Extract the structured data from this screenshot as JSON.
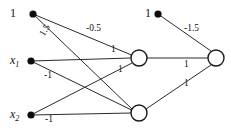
{
  "diagram": {
    "background_color": "#ffffff",
    "stroke_color": "#2b2b2b",
    "node_fill": "#ffffff",
    "width": 231,
    "height": 130
  },
  "nodes": {
    "bias_top_left": {
      "label": "1",
      "x": 33,
      "y": 14,
      "type": "filled-dot"
    },
    "input_x1": {
      "label": "x",
      "subscript": "1",
      "x": 31,
      "y": 61,
      "type": "filled-dot"
    },
    "input_x2": {
      "label": "x",
      "subscript": "2",
      "x": 31,
      "y": 115,
      "type": "filled-dot"
    },
    "bias_top_right": {
      "label": "1",
      "x": 158,
      "y": 14,
      "type": "filled-dot"
    },
    "hidden_top": {
      "label": "",
      "x": 139,
      "y": 58,
      "type": "circle"
    },
    "hidden_bottom": {
      "label": "",
      "x": 139,
      "y": 113,
      "type": "circle"
    },
    "output": {
      "label": "",
      "x": 216,
      "y": 58,
      "type": "circle"
    }
  },
  "weights": {
    "bias_to_hidden_top": "-0.5",
    "bias_to_hidden_bottom": "1.5",
    "x1_to_hidden_top": "1",
    "x1_to_hidden_bottom": "-1",
    "x2_to_hidden_top": "1",
    "x2_to_hidden_bottom": "-1",
    "bias_to_output": "-1.5",
    "hidden_top_to_output": "1",
    "hidden_bottom_to_output": "1"
  },
  "weight_positions": {
    "bias_to_hidden_bottom": {
      "x": 45,
      "y": 38,
      "rotate": -58
    },
    "bias_to_hidden_top": {
      "x": 95,
      "y": 30,
      "rotate": 0
    },
    "x1_to_hidden_top": {
      "x": 114,
      "y": 51,
      "rotate": 0
    },
    "x1_to_hidden_bottom": {
      "x": 48,
      "y": 77,
      "rotate": 0
    },
    "x2_to_hidden_top": {
      "x": 121,
      "y": 71,
      "rotate": 0
    },
    "x2_to_hidden_bottom": {
      "x": 49,
      "y": 121,
      "rotate": 0
    },
    "bias_to_output": {
      "x": 193,
      "y": 30,
      "rotate": 0
    },
    "hidden_top_to_output": {
      "x": 187,
      "y": 65,
      "rotate": 0
    },
    "hidden_bottom_to_output": {
      "x": 187,
      "y": 84,
      "rotate": 0
    }
  }
}
